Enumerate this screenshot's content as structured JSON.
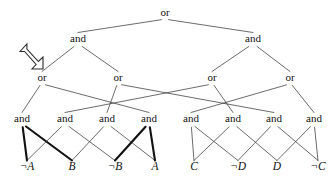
{
  "figure": {
    "background_color": "#ffffff",
    "line_color": "#3a3a3a",
    "bold_line_color": "#111111",
    "text_color": "#111111"
  },
  "pointer": {
    "icon": "arrow-down-right-icon",
    "description": "hollow block arrow pointing down-right toward the leftmost or-node",
    "x": 20,
    "y": 44,
    "width": 23,
    "height": 25
  },
  "nodes": {
    "root": {
      "id": "n0",
      "label": "or",
      "x": 165,
      "y": 16,
      "level": 0
    },
    "level1": [
      {
        "id": "n1",
        "label": "and",
        "x": 78,
        "y": 42,
        "level": 1
      },
      {
        "id": "n2",
        "label": "and",
        "x": 253,
        "y": 42,
        "level": 1
      }
    ],
    "level2": [
      {
        "id": "n3",
        "label": "or",
        "x": 42,
        "y": 81,
        "level": 2
      },
      {
        "id": "n4",
        "label": "or",
        "x": 118,
        "y": 81,
        "level": 2
      },
      {
        "id": "n5",
        "label": "or",
        "x": 212,
        "y": 81,
        "level": 2
      },
      {
        "id": "n6",
        "label": "or",
        "x": 290,
        "y": 81,
        "level": 2
      }
    ],
    "level3": [
      {
        "id": "n7",
        "label": "and",
        "x": 22,
        "y": 122,
        "level": 3
      },
      {
        "id": "n8",
        "label": "and",
        "x": 65,
        "y": 122,
        "level": 3
      },
      {
        "id": "n9",
        "label": "and",
        "x": 107,
        "y": 122,
        "level": 3
      },
      {
        "id": "n10",
        "label": "and",
        "x": 149,
        "y": 122,
        "level": 3
      },
      {
        "id": "n11",
        "label": "and",
        "x": 191,
        "y": 122,
        "level": 3
      },
      {
        "id": "n12",
        "label": "and",
        "x": 233,
        "y": 122,
        "level": 3
      },
      {
        "id": "n13",
        "label": "and",
        "x": 274,
        "y": 122,
        "level": 3
      },
      {
        "id": "n14",
        "label": "and",
        "x": 314,
        "y": 122,
        "level": 3
      }
    ],
    "leaves": [
      {
        "id": "l1",
        "label": "¬A",
        "x": 27,
        "y": 170,
        "level": 4
      },
      {
        "id": "l2",
        "label": "B",
        "x": 72,
        "y": 170,
        "level": 4
      },
      {
        "id": "l3",
        "label": "¬B",
        "x": 115,
        "y": 170,
        "level": 4
      },
      {
        "id": "l4",
        "label": "A",
        "x": 155,
        "y": 170,
        "level": 4
      },
      {
        "id": "l5",
        "label": "C",
        "x": 194,
        "y": 170,
        "level": 4
      },
      {
        "id": "l6",
        "label": "¬D",
        "x": 238,
        "y": 170,
        "level": 4
      },
      {
        "id": "l7",
        "label": "D",
        "x": 277,
        "y": 170,
        "level": 4
      },
      {
        "id": "l8",
        "label": "¬C",
        "x": 318,
        "y": 170,
        "level": 4
      }
    ]
  },
  "edges": [
    {
      "from": "n0",
      "to": "n1",
      "weight": "thin"
    },
    {
      "from": "n0",
      "to": "n2",
      "weight": "thin"
    },
    {
      "from": "n1",
      "to": "n3",
      "weight": "thin"
    },
    {
      "from": "n1",
      "to": "n4",
      "weight": "thin"
    },
    {
      "from": "n2",
      "to": "n5",
      "weight": "thin"
    },
    {
      "from": "n2",
      "to": "n6",
      "weight": "thin"
    },
    {
      "from": "n3",
      "to": "n7",
      "weight": "thin"
    },
    {
      "from": "n3",
      "to": "n10",
      "weight": "thin"
    },
    {
      "from": "n4",
      "to": "n9",
      "weight": "thin"
    },
    {
      "from": "n4",
      "to": "n13",
      "weight": "thin"
    },
    {
      "from": "n5",
      "to": "n8",
      "weight": "thin"
    },
    {
      "from": "n5",
      "to": "n12",
      "weight": "thin"
    },
    {
      "from": "n6",
      "to": "n11",
      "weight": "thin"
    },
    {
      "from": "n6",
      "to": "n14",
      "weight": "thin"
    },
    {
      "from": "n7",
      "to": "l1",
      "weight": "bold"
    },
    {
      "from": "n7",
      "to": "l2",
      "weight": "bold"
    },
    {
      "from": "n8",
      "to": "l1",
      "weight": "thin"
    },
    {
      "from": "n8",
      "to": "l3",
      "weight": "thin"
    },
    {
      "from": "n9",
      "to": "l2",
      "weight": "thin"
    },
    {
      "from": "n9",
      "to": "l4",
      "weight": "thin"
    },
    {
      "from": "n10",
      "to": "l3",
      "weight": "bold"
    },
    {
      "from": "n10",
      "to": "l4",
      "weight": "bold"
    },
    {
      "from": "n11",
      "to": "l5",
      "weight": "thin"
    },
    {
      "from": "n11",
      "to": "l6",
      "weight": "thin"
    },
    {
      "from": "n12",
      "to": "l5",
      "weight": "thin"
    },
    {
      "from": "n12",
      "to": "l7",
      "weight": "thin"
    },
    {
      "from": "n13",
      "to": "l6",
      "weight": "thin"
    },
    {
      "from": "n13",
      "to": "l8",
      "weight": "thin"
    },
    {
      "from": "n14",
      "to": "l7",
      "weight": "thin"
    },
    {
      "from": "n14",
      "to": "l8",
      "weight": "thin"
    }
  ]
}
